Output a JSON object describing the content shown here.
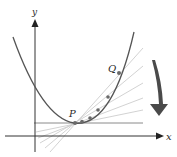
{
  "diagram": {
    "axes": {
      "x_label": "x",
      "y_label": "y"
    },
    "points": {
      "P_label": "P",
      "Q_label": "Q"
    },
    "colors": {
      "curve": "#555555",
      "axes": "#333333",
      "secants": "#c8c8c8",
      "tangent": "#8a8a8a",
      "points": "#6a6a6a",
      "arrow": "#4a4a4a"
    },
    "curve_points_on_parabola": [
      {
        "x": 75,
        "y": 123
      },
      {
        "x": 82,
        "y": 121
      },
      {
        "x": 90,
        "y": 117
      },
      {
        "x": 98,
        "y": 110
      },
      {
        "x": 108,
        "y": 97
      },
      {
        "x": 119,
        "y": 73
      }
    ],
    "arrow_direction": "down"
  }
}
